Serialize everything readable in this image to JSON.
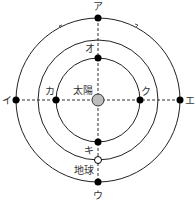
{
  "diagram": {
    "center": {
      "x": 98,
      "y": 100
    },
    "sun": {
      "label": "太陽",
      "fill": "#bdbdbd"
    },
    "orbits": [
      {
        "name": "outer-orbit",
        "r": 82
      },
      {
        "name": "earth-orbit",
        "r": 60
      },
      {
        "name": "inner-orbit",
        "r": 42
      }
    ],
    "points": [
      {
        "label": "ア",
        "position": "outer-top"
      },
      {
        "label": "イ",
        "position": "outer-left"
      },
      {
        "label": "ウ",
        "position": "outer-bottom"
      },
      {
        "label": "エ",
        "position": "outer-right"
      },
      {
        "label": "オ",
        "position": "inner-top"
      },
      {
        "label": "カ",
        "position": "inner-left"
      },
      {
        "label": "キ",
        "position": "inner-bottom"
      },
      {
        "label": "ク",
        "position": "inner-right"
      }
    ],
    "earth": {
      "label": "地球",
      "position": "earth-orbit-bottom"
    },
    "labels": {
      "a": "ア",
      "i": "イ",
      "u": "ウ",
      "e": "エ",
      "o": "オ",
      "ka": "カ",
      "ki": "キ",
      "ku": "ク",
      "sun": "太陽",
      "earth": "地球"
    }
  }
}
